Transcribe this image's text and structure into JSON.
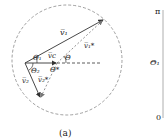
{
  "panel_a": {
    "caption": "(a)",
    "labels": {
      "v1": "v̅₁",
      "vc": "v̅c",
      "v2": "v̅₂",
      "v1s": "v̅₁*",
      "v2s": "v̅₂*",
      "theta1": "Θ₁",
      "theta2": "Θ₂",
      "thetaStar": "Θ*",
      "theta": "Θ"
    }
  },
  "panel_b": {
    "y_top": "π",
    "y_label": "Θ₁",
    "y_bottom": "0"
  },
  "colors": {
    "line": "#333333",
    "dashed": "#777777"
  }
}
